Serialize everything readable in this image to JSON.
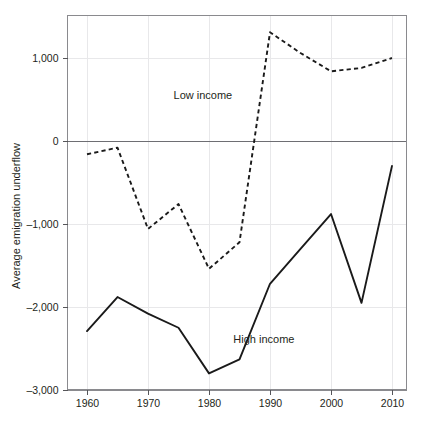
{
  "chart_data": {
    "type": "line",
    "title": "",
    "subtitle": "",
    "xlabel": "",
    "ylabel": "Average emigration underflow",
    "x": [
      1960,
      1965,
      1970,
      1975,
      1980,
      1985,
      1990,
      1995,
      2000,
      2005,
      2010
    ],
    "xlim": [
      1958,
      2012
    ],
    "ylim": [
      -3000,
      1500
    ],
    "xticks": [
      1960,
      1970,
      1980,
      1990,
      2000,
      2010
    ],
    "xtick_labels": [
      "1960",
      "1970",
      "1980",
      "1990",
      "2000",
      "2010"
    ],
    "yticks": [
      1000,
      0,
      -1000,
      -2000,
      -3000
    ],
    "ytick_labels": [
      "1,000",
      "0",
      "–1,000",
      "–2,000",
      "–3,000"
    ],
    "grid": true,
    "grid_axis": "both",
    "legend_position": "inline-annotation",
    "zero_line": 0,
    "series": [
      {
        "name": "Low income",
        "style": "dashed",
        "color": "#1a1a1a",
        "label_text": "Low income",
        "label_x": 1979,
        "label_y": 510,
        "values": [
          -160,
          -80,
          -1060,
          -760,
          -1540,
          -1220,
          1310,
          1060,
          840,
          880,
          1000
        ]
      },
      {
        "name": "High income",
        "style": "solid",
        "color": "#1a1a1a",
        "label_text": "High income",
        "label_x": 1989,
        "label_y": -2430,
        "values": [
          -2290,
          -1880,
          -2080,
          -2250,
          -2800,
          -2630,
          -1720,
          -1300,
          -880,
          -1950,
          -300
        ]
      }
    ],
    "annotations": [
      {
        "text": "Low income",
        "x": 1979,
        "y": 510
      },
      {
        "text": "High income",
        "x": 1989,
        "y": -2430
      }
    ]
  }
}
